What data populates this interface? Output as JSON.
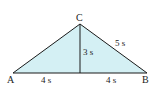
{
  "diagram": {
    "type": "triangle",
    "fill_color": "#d4f0f4",
    "stroke_color": "#1a1a1a",
    "vertices": {
      "A": {
        "label": "A"
      },
      "B": {
        "label": "B"
      },
      "C": {
        "label": "C"
      }
    },
    "labels": {
      "left_base": "4 s",
      "right_base": "4 s",
      "height": "3 s",
      "hypotenuse": "5 s"
    }
  }
}
